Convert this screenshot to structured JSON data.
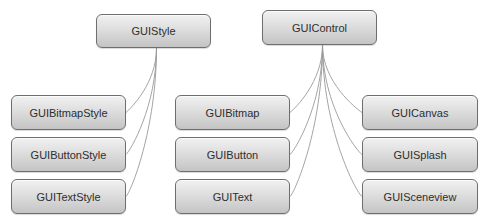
{
  "diagram": {
    "type": "class-hierarchy",
    "roots": [
      {
        "id": "guistyle",
        "label": "GUIStyle",
        "children": [
          {
            "id": "guibitmapstyle",
            "label": "GUIBitmapStyle"
          },
          {
            "id": "guibuttonstyle",
            "label": "GUIButtonStyle"
          },
          {
            "id": "guitextstyle",
            "label": "GUITextStyle"
          }
        ]
      },
      {
        "id": "guicontrol",
        "label": "GUIControl",
        "children": [
          {
            "id": "guibitmap",
            "label": "GUIBitmap"
          },
          {
            "id": "guibutton",
            "label": "GUIButton"
          },
          {
            "id": "guitext",
            "label": "GUIText"
          },
          {
            "id": "guicanvas",
            "label": "GUICanvas"
          },
          {
            "id": "guisplash",
            "label": "GUISplash"
          },
          {
            "id": "guisceneview",
            "label": "GUISceneview"
          }
        ]
      }
    ],
    "colors": {
      "node_fill_top": "#f1f1f1",
      "node_fill_bottom": "#c4c4c4",
      "node_border": "#6e6e6e",
      "connector": "#9a9a9a",
      "text": "#2e2e2e"
    }
  }
}
